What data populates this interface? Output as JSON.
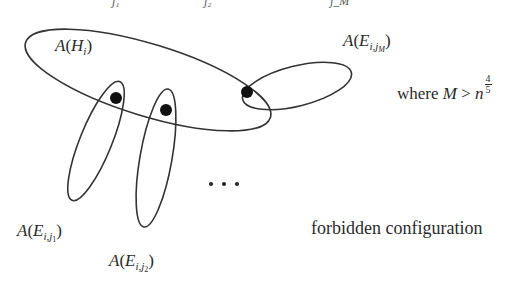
{
  "diagram": {
    "labels": {
      "hyperedge_H": {
        "fn": "A",
        "var": "H",
        "sub": "i"
      },
      "edge_jM": {
        "fn": "A",
        "var": "E",
        "sub": "i,",
        "subsub_base": "j",
        "subsub": "M"
      },
      "edge_j1": {
        "fn": "A",
        "var": "E",
        "sub": "i,",
        "subsub_base": "j",
        "subsub": "1"
      },
      "edge_j2": {
        "fn": "A",
        "var": "E",
        "sub": "i,",
        "subsub_base": "j",
        "subsub": "2"
      },
      "ellipsis": "…",
      "condition_prefix": "where",
      "condition_var": "M",
      "condition_op": ">",
      "condition_base": "n",
      "condition_exp_num": "4",
      "condition_exp_den": "5",
      "caption": "forbidden configuration"
    },
    "cutoff_top": [
      "j₁",
      "j₂",
      "j_M"
    ],
    "shapes": {
      "stroke_color": "#333333",
      "dot_color": "#111111",
      "ellipses": [
        {
          "name": "big-ellipse-H",
          "cx": 148,
          "cy": 80,
          "rx": 128,
          "ry": 36,
          "rotate": 17
        },
        {
          "name": "right-ellipse-jM",
          "cx": 297,
          "cy": 86,
          "rx": 56,
          "ry": 20,
          "rotate": -14
        },
        {
          "name": "ellipse-j1",
          "cx": 96,
          "cy": 141,
          "rx": 16,
          "ry": 64,
          "rotate": 22
        },
        {
          "name": "ellipse-j2",
          "cx": 156,
          "cy": 158,
          "rx": 16,
          "ry": 70,
          "rotate": 10
        }
      ],
      "dots": [
        {
          "name": "shared-vertex-j1",
          "cx": 116,
          "cy": 98,
          "r": 6
        },
        {
          "name": "shared-vertex-j2",
          "cx": 166,
          "cy": 110,
          "r": 6
        },
        {
          "name": "shared-vertex-jM",
          "cx": 247,
          "cy": 92,
          "r": 6
        }
      ],
      "ellipsis_dots": [
        {
          "cx": 211,
          "cy": 184
        },
        {
          "cx": 224,
          "cy": 184
        },
        {
          "cx": 237,
          "cy": 184
        }
      ]
    }
  }
}
